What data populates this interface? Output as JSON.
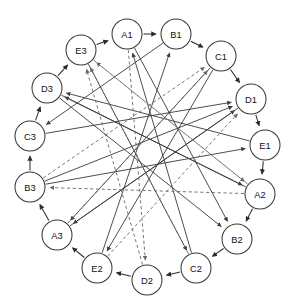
{
  "diagram": {
    "type": "directed-graph",
    "node_radius": 15,
    "layout": "circular-ring",
    "colors": {
      "background": "#ffffff",
      "node_fill": "#ffffff",
      "node_stroke": "#3a3a3a",
      "ring_edge": "#2b2b2b",
      "chord_solid": "#3d3d3d",
      "chord_dashed": "#6a6a6a",
      "label": "#111111"
    },
    "nodes": [
      {
        "id": "A1",
        "label": "A1",
        "x": 127,
        "y": 34
      },
      {
        "id": "B1",
        "label": "B1",
        "x": 176,
        "y": 34
      },
      {
        "id": "C1",
        "label": "C1",
        "x": 221,
        "y": 56
      },
      {
        "id": "D1",
        "label": "D1",
        "x": 251,
        "y": 99
      },
      {
        "id": "E1",
        "label": "E1",
        "x": 265,
        "y": 145
      },
      {
        "id": "A2",
        "label": "A2",
        "x": 260,
        "y": 194
      },
      {
        "id": "B2",
        "label": "B2",
        "x": 237,
        "y": 239
      },
      {
        "id": "C2",
        "label": "C2",
        "x": 196,
        "y": 268
      },
      {
        "id": "D2",
        "label": "D2",
        "x": 147,
        "y": 280
      },
      {
        "id": "E2",
        "label": "E2",
        "x": 97,
        "y": 268
      },
      {
        "id": "A3",
        "label": "A3",
        "x": 57,
        "y": 235
      },
      {
        "id": "B3",
        "label": "B3",
        "x": 30,
        "y": 187
      },
      {
        "id": "C3",
        "label": "C3",
        "x": 30,
        "y": 136
      },
      {
        "id": "D3",
        "label": "D3",
        "x": 47,
        "y": 88
      },
      {
        "id": "E3",
        "label": "E3",
        "x": 81,
        "y": 50
      }
    ],
    "ring_edges": [
      {
        "from": "A1",
        "to": "B1"
      },
      {
        "from": "B1",
        "to": "C1"
      },
      {
        "from": "C1",
        "to": "D1"
      },
      {
        "from": "D1",
        "to": "E1"
      },
      {
        "from": "E1",
        "to": "A2"
      },
      {
        "from": "A2",
        "to": "B2"
      },
      {
        "from": "B2",
        "to": "C2"
      },
      {
        "from": "C2",
        "to": "D2"
      },
      {
        "from": "D2",
        "to": "E2"
      },
      {
        "from": "E2",
        "to": "A3"
      },
      {
        "from": "A3",
        "to": "B3"
      },
      {
        "from": "B3",
        "to": "C3"
      },
      {
        "from": "C3",
        "to": "D3"
      },
      {
        "from": "D3",
        "to": "E3"
      },
      {
        "from": "E3",
        "to": "A1"
      }
    ],
    "chord_edges": [
      {
        "from": "C2",
        "to": "A1",
        "style": "solid"
      },
      {
        "from": "E2",
        "to": "B1",
        "style": "solid"
      },
      {
        "from": "A3",
        "to": "D1",
        "style": "solid"
      },
      {
        "from": "B3",
        "to": "D1",
        "style": "solid"
      },
      {
        "from": "D3",
        "to": "A2",
        "style": "solid"
      },
      {
        "from": "C1",
        "to": "A3",
        "style": "solid"
      },
      {
        "from": "D1",
        "to": "A3",
        "style": "solid"
      },
      {
        "from": "B1",
        "to": "C3",
        "style": "solid"
      },
      {
        "from": "C1",
        "to": "E2",
        "style": "solid"
      },
      {
        "from": "E3",
        "to": "C2",
        "style": "solid"
      },
      {
        "from": "D3",
        "to": "B2",
        "style": "solid"
      },
      {
        "from": "A1",
        "to": "B2",
        "style": "solid"
      },
      {
        "from": "B3",
        "to": "E1",
        "style": "solid"
      },
      {
        "from": "A2",
        "to": "D3",
        "style": "solid"
      },
      {
        "from": "E1",
        "to": "D3",
        "style": "solid"
      },
      {
        "from": "C3",
        "to": "D1",
        "style": "solid"
      },
      {
        "from": "A2",
        "to": "E3",
        "style": "dashed"
      },
      {
        "from": "C2",
        "to": "E3",
        "style": "dashed"
      },
      {
        "from": "A2",
        "to": "B3",
        "style": "dashed"
      },
      {
        "from": "A1",
        "to": "D2",
        "style": "dashed"
      },
      {
        "from": "B3",
        "to": "C1",
        "style": "dashed"
      },
      {
        "from": "E3",
        "to": "A2",
        "style": "dashed"
      },
      {
        "from": "A3",
        "to": "C1",
        "style": "dashed"
      },
      {
        "from": "E2",
        "to": "D1",
        "style": "dashed"
      },
      {
        "from": "D2",
        "to": "E3",
        "style": "dashed"
      }
    ]
  }
}
